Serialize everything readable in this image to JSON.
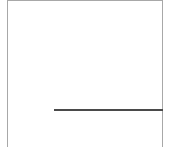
{
  "diagram": {
    "colors": {
      "frame": "#a8a8a8",
      "divider": "#4a4a4a",
      "background": "#ffffff"
    },
    "elements": [
      {
        "name": "top-border",
        "kind": "line"
      },
      {
        "name": "left-border",
        "kind": "line"
      },
      {
        "name": "right-border",
        "kind": "line"
      },
      {
        "name": "horizontal-divider",
        "kind": "line"
      }
    ]
  }
}
